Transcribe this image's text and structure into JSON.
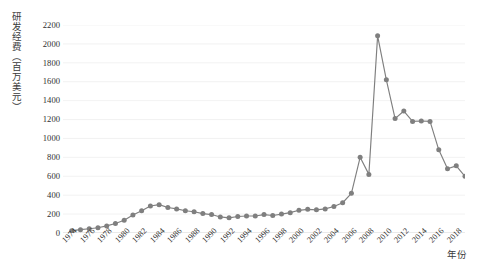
{
  "chart_data": {
    "type": "line",
    "title": "",
    "xlabel": "年份",
    "ylabel": "研发经费（百万美元）",
    "ylim": [
      0,
      2200
    ],
    "ytick_step": 200,
    "yticks": [
      2200,
      2000,
      1800,
      1600,
      1400,
      1200,
      1000,
      800,
      600,
      400,
      200,
      0
    ],
    "xlim": [
      1973,
      2019
    ],
    "xtick_labels": [
      "1974",
      "1976",
      "1978",
      "1980",
      "1982",
      "1984",
      "1986",
      "1988",
      "1990",
      "1992",
      "1994",
      "1996",
      "1998",
      "2000",
      "2002",
      "2004",
      "2006",
      "2008",
      "2010",
      "2012",
      "2014",
      "2016",
      "2018"
    ],
    "grid": true,
    "grid_axis": "y",
    "legend": "none",
    "marker": "circle",
    "series_color": "#7f7f7f",
    "x": [
      1974,
      1975,
      1976,
      1977,
      1978,
      1979,
      1980,
      1981,
      1982,
      1983,
      1984,
      1985,
      1986,
      1987,
      1988,
      1989,
      1990,
      1991,
      1992,
      1993,
      1994,
      1995,
      1996,
      1997,
      1998,
      1999,
      2000,
      2001,
      2002,
      2003,
      2004,
      2005,
      2006,
      2007,
      2008,
      2009,
      2010,
      2011,
      2012,
      2013,
      2014,
      2015,
      2016,
      2017,
      2018,
      2019
    ],
    "values": [
      25,
      35,
      45,
      55,
      75,
      100,
      135,
      190,
      235,
      285,
      300,
      270,
      255,
      235,
      225,
      205,
      195,
      170,
      160,
      175,
      180,
      180,
      195,
      185,
      200,
      215,
      240,
      250,
      245,
      255,
      280,
      320,
      420,
      800,
      620,
      2085,
      1620,
      1210,
      1290,
      1180,
      1185,
      1180,
      880,
      680,
      710,
      600
    ],
    "units": "百万美元"
  }
}
